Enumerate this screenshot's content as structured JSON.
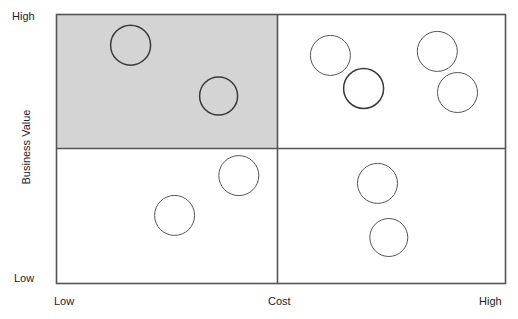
{
  "chart_data": {
    "type": "scatter",
    "title": "",
    "xlabel": "Cost",
    "ylabel": "Business Value",
    "x_tick_labels": [
      "Low",
      "Cost",
      "High"
    ],
    "y_tick_labels": [
      "High",
      "Low"
    ],
    "xlim": [
      "Low",
      "High"
    ],
    "ylim": [
      "Low",
      "High"
    ],
    "grid": false,
    "legend": "none",
    "quadrants": [
      {
        "name": "high-value-low-cost",
        "x_range": [
          "Low",
          "Mid"
        ],
        "y_range": [
          "Mid",
          "High"
        ],
        "highlighted": true,
        "fill": "#d4d4d4",
        "point_count": 3
      },
      {
        "name": "high-value-high-cost",
        "x_range": [
          "Mid",
          "High"
        ],
        "y_range": [
          "Mid",
          "High"
        ],
        "highlighted": false,
        "fill": "#ffffff",
        "point_count": 3
      },
      {
        "name": "low-value-low-cost",
        "x_range": [
          "Low",
          "Mid"
        ],
        "y_range": [
          "Low",
          "Mid"
        ],
        "highlighted": false,
        "fill": "#ffffff",
        "point_count": 2
      },
      {
        "name": "low-value-high-cost",
        "x_range": [
          "Mid",
          "High"
        ],
        "y_range": [
          "Low",
          "Mid"
        ],
        "highlighted": false,
        "fill": "#ffffff",
        "point_count": 2
      }
    ],
    "points": [
      {
        "id": 1,
        "quadrant": "high-value-low-cost",
        "cost": 0.165,
        "value": 0.886,
        "radius": 20,
        "emphasis": "bold"
      },
      {
        "id": 2,
        "quadrant": "high-value-low-cost",
        "cost": 0.361,
        "value": 0.697,
        "radius": 19,
        "emphasis": "bold"
      },
      {
        "id": 3,
        "quadrant": "high-value-low-cost",
        "cost": 0.684,
        "value": 0.725,
        "radius": 20,
        "emphasis": "bold"
      },
      {
        "id": 4,
        "quadrant": "high-value-high-cost",
        "cost": 0.61,
        "value": 0.848,
        "radius": 20,
        "emphasis": "normal"
      },
      {
        "id": 5,
        "quadrant": "high-value-high-cost",
        "cost": 0.848,
        "value": 0.863,
        "radius": 20,
        "emphasis": "normal"
      },
      {
        "id": 6,
        "quadrant": "high-value-high-cost",
        "cost": 0.893,
        "value": 0.71,
        "radius": 20,
        "emphasis": "normal"
      },
      {
        "id": 7,
        "quadrant": "low-value-low-cost",
        "cost": 0.263,
        "value": 0.253,
        "radius": 20,
        "emphasis": "normal"
      },
      {
        "id": 8,
        "quadrant": "low-value-low-cost",
        "cost": 0.406,
        "value": 0.401,
        "radius": 20,
        "emphasis": "normal"
      },
      {
        "id": 9,
        "quadrant": "low-value-high-cost",
        "cost": 0.715,
        "value": 0.372,
        "radius": 20,
        "emphasis": "normal"
      },
      {
        "id": 10,
        "quadrant": "low-value-high-cost",
        "cost": 0.74,
        "value": 0.171,
        "radius": 19,
        "emphasis": "normal"
      }
    ],
    "colors": {
      "frame": "#555555",
      "divider": "#555555",
      "bubble_stroke": "#555555",
      "bubble_stroke_emphasis": "#3a3a3a",
      "bubble_fill": "none",
      "highlight_fill": "#d4d4d4",
      "text": "#222222",
      "background": "#ffffff"
    }
  },
  "labels": {
    "y_title": "Business Value",
    "y_high": "High",
    "y_low": "Low",
    "x_low": "Low",
    "x_title": "Cost",
    "x_high": "High"
  }
}
